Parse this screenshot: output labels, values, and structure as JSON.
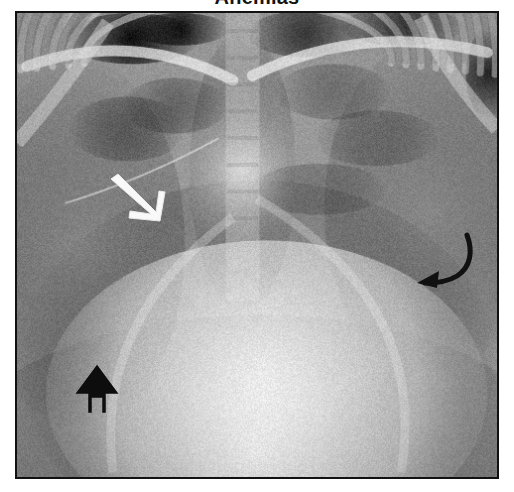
{
  "figure": {
    "title": "Anemias",
    "kind": "chest-radiograph",
    "caption_visible": false
  },
  "image": {
    "modality": "X-ray",
    "view": "frontal chest radiograph (AP)",
    "frame": {
      "x": 15,
      "y": 11,
      "width": 484,
      "height": 468,
      "border_color": "#111111",
      "border_width_px": 2
    },
    "tone": {
      "background": "#9a9a9a",
      "darkest": "#0c0c0c",
      "lightest": "#f2f2f2",
      "lung_field": "#8d8d8d",
      "bone": "#d8d8d8",
      "heart_silhouette": "#d5d5d5"
    }
  },
  "annotations": [
    {
      "id": "white-arrow",
      "label": "white arrow",
      "color": "#f7f7f7",
      "style": "open stroked arrow",
      "direction": "down-right",
      "x": 92,
      "y": 160,
      "width": 58,
      "height": 52,
      "points_to": "right upper lung field"
    },
    {
      "id": "black-curved-arrow",
      "label": "black curved arrow",
      "color": "#111111",
      "style": "curved tapered arrow",
      "direction": "down-left",
      "x": 396,
      "y": 218,
      "width": 62,
      "height": 60,
      "points_to": "left lateral chest wall"
    },
    {
      "id": "black-outline-up-arrow",
      "label": "black outlined arrow",
      "color": "#111111",
      "style": "hollow outlined block arrow",
      "direction": "up",
      "x": 55,
      "y": 350,
      "width": 50,
      "height": 52,
      "points_to": "right lower lung zone"
    }
  ],
  "colors": {
    "page_background": "#ffffff",
    "title_text": "#141414",
    "frame_border": "#111111"
  }
}
